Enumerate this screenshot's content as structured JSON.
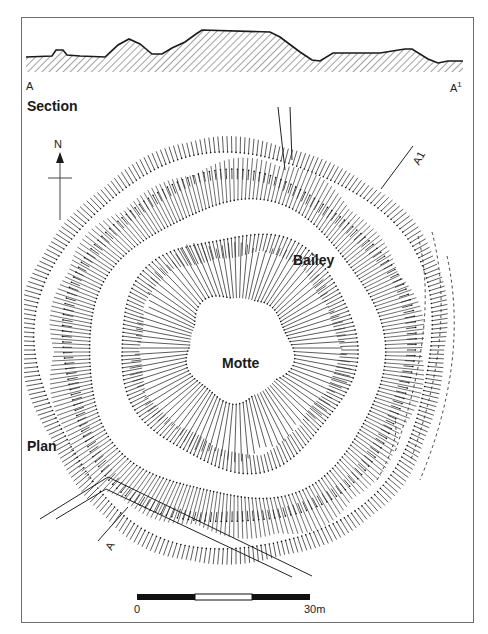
{
  "figure": {
    "section_title": "Section",
    "plan_title": "Plan",
    "section_start_label": "A",
    "section_end_label": "A",
    "section_end_superscript": "1",
    "plan_line_label_start": "A",
    "plan_line_label_end": "A1",
    "features": {
      "motte_label": "Motte",
      "bailey_label": "Bailey"
    },
    "north_arrow": {
      "label": "N"
    },
    "scale_bar": {
      "start_label": "0",
      "end_label": "30m",
      "segments": [
        "black",
        "white",
        "black"
      ]
    },
    "colors": {
      "ink": "#1a1a1a",
      "frame": "#6e6e6e",
      "hatch": "#555555",
      "background": "#ffffff"
    },
    "section_profile": [
      [
        26,
        57
      ],
      [
        52,
        56
      ],
      [
        56,
        50
      ],
      [
        63,
        50
      ],
      [
        67,
        55
      ],
      [
        80,
        56
      ],
      [
        105,
        57
      ],
      [
        118,
        45
      ],
      [
        129,
        39
      ],
      [
        140,
        44
      ],
      [
        152,
        54
      ],
      [
        162,
        54
      ],
      [
        172,
        48
      ],
      [
        185,
        42
      ],
      [
        196,
        34
      ],
      [
        202,
        30
      ],
      [
        270,
        32
      ],
      [
        280,
        37
      ],
      [
        300,
        52
      ],
      [
        312,
        60
      ],
      [
        320,
        61
      ],
      [
        333,
        53
      ],
      [
        380,
        53
      ],
      [
        405,
        49
      ],
      [
        412,
        49
      ],
      [
        428,
        59
      ],
      [
        438,
        63
      ],
      [
        448,
        61
      ],
      [
        463,
        61
      ]
    ],
    "plan_rings": [
      {
        "cx": 238,
        "cy": 348,
        "r": 52,
        "len": 58,
        "dir": "out",
        "step": 3.2,
        "weight": 0.8
      },
      {
        "cx": 238,
        "cy": 350,
        "r": 118,
        "len": 20,
        "dir": "in",
        "step": 4,
        "weight": 0.8
      },
      {
        "cx": 236,
        "cy": 352,
        "r": 148,
        "len": 42,
        "dir": "out",
        "step": 3.6,
        "weight": 0.7
      },
      {
        "cx": 236,
        "cy": 350,
        "r": 176,
        "len": 10,
        "dir": "in",
        "step": 5.5,
        "weight": 0.9
      },
      {
        "cx": 236,
        "cy": 350,
        "r": 198,
        "len": 16,
        "dir": "out",
        "step": 4.2,
        "weight": 0.8
      }
    ]
  }
}
